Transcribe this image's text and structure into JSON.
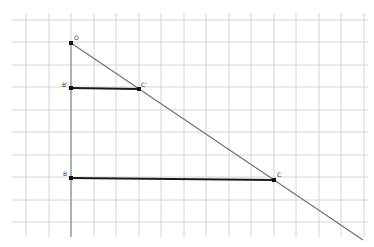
{
  "figure": {
    "type": "geometry-construction",
    "grid": {
      "x_lines": [
        26,
        49,
        71,
        94,
        116,
        139,
        161,
        184,
        206,
        229,
        251,
        274,
        296,
        319,
        341,
        364
      ],
      "y_lines": [
        20,
        42,
        65,
        87,
        110,
        132,
        155,
        177,
        200,
        222
      ],
      "x_extent": [
        12,
        368
      ],
      "y_extent": [
        13,
        237
      ],
      "color": "#d4d4d4"
    },
    "points": [
      {
        "name": "O",
        "label": "O",
        "x": 71,
        "y": 43,
        "label_dx": 3,
        "label_dy": -3
      },
      {
        "name": "B'",
        "label": "B'",
        "x": 71,
        "y": 88,
        "label_dx": -9,
        "label_dy": -1
      },
      {
        "name": "C'",
        "label": "C'",
        "x": 139,
        "y": 89,
        "label_dx": 2,
        "label_dy": -2
      },
      {
        "name": "B",
        "label": "B",
        "x": 71,
        "y": 178,
        "label_dx": -8,
        "label_dy": -2
      },
      {
        "name": "C",
        "label": "C",
        "x": 274,
        "y": 180,
        "label_dx": 3,
        "label_dy": -3
      }
    ],
    "segments": [
      {
        "name": "B'C'",
        "from": "B'",
        "to": "C'",
        "style": "bold"
      },
      {
        "name": "BC",
        "from": "B",
        "to": "C",
        "style": "bold"
      }
    ],
    "lines": [
      {
        "name": "ray-OB",
        "x1": 71,
        "y1": 43,
        "x2": 71,
        "y2": 237,
        "style": "axis"
      },
      {
        "name": "ray-OC",
        "x1": 71,
        "y1": 43,
        "x2": 363,
        "y2": 240,
        "style": "thin"
      }
    ]
  }
}
